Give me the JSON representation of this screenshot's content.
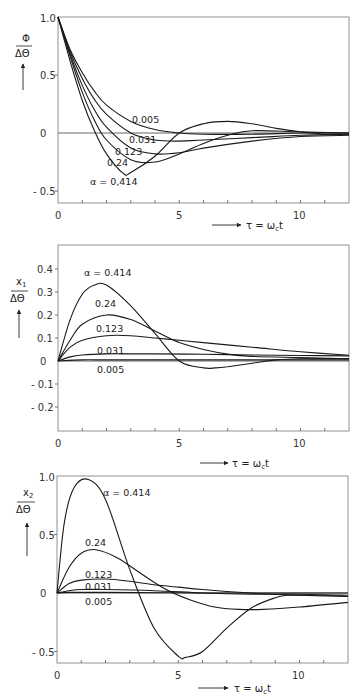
{
  "chart_data": [
    {
      "type": "line",
      "title": "",
      "ylabel_num": "Φ",
      "ylabel_den": "ΔΘ",
      "xlabel": "τ = ω_c t",
      "xlim": [
        0,
        12
      ],
      "ylim": [
        -0.6,
        1.0
      ],
      "xticks": [
        0,
        5,
        10
      ],
      "yticks": [
        1.0,
        0.5,
        0,
        -0.5
      ],
      "ytick_labels": [
        "1.0",
        "0.5",
        "0",
        "- 0.5"
      ],
      "series": [
        {
          "name": "0.005",
          "x": [
            0,
            0.5,
            1,
            1.5,
            2,
            3,
            4,
            5,
            6,
            8,
            10,
            12
          ],
          "y": [
            1.0,
            0.72,
            0.52,
            0.36,
            0.24,
            0.1,
            0.03,
            0.0,
            -0.01,
            -0.01,
            0.0,
            0.0
          ]
        },
        {
          "name": "0.031",
          "x": [
            0,
            0.5,
            1,
            1.5,
            2,
            3,
            4,
            5,
            6,
            8,
            10,
            12
          ],
          "y": [
            1.0,
            0.7,
            0.47,
            0.29,
            0.16,
            0.0,
            -0.06,
            -0.07,
            -0.06,
            -0.04,
            -0.02,
            -0.01
          ]
        },
        {
          "name": "0.123",
          "x": [
            0,
            0.5,
            1,
            1.5,
            2,
            3,
            4,
            5,
            6,
            8,
            10,
            12
          ],
          "y": [
            1.0,
            0.68,
            0.41,
            0.2,
            0.05,
            -0.13,
            -0.18,
            -0.17,
            -0.13,
            -0.07,
            -0.03,
            -0.02
          ]
        },
        {
          "name": "0.24",
          "x": [
            0,
            0.5,
            1,
            1.5,
            2,
            3,
            4,
            5,
            6,
            7,
            8,
            10,
            12
          ],
          "y": [
            1.0,
            0.66,
            0.35,
            0.11,
            -0.06,
            -0.23,
            -0.25,
            -0.18,
            -0.09,
            -0.02,
            0.02,
            0.01,
            0.0
          ]
        },
        {
          "name": "α = 0.414",
          "x": [
            0,
            0.5,
            1,
            1.5,
            2,
            2.7,
            3,
            4,
            5,
            6,
            7,
            8,
            9,
            10,
            11,
            12
          ],
          "y": [
            1.0,
            0.62,
            0.28,
            0.02,
            -0.18,
            -0.35,
            -0.34,
            -0.2,
            0.0,
            0.08,
            0.1,
            0.08,
            0.04,
            0.01,
            -0.01,
            -0.01
          ]
        }
      ]
    },
    {
      "type": "line",
      "title": "",
      "ylabel_num": "x₁",
      "ylabel_den": "ΔΘ",
      "xlabel": "τ = ω_c t",
      "xlim": [
        0,
        12
      ],
      "ylim": [
        -0.3,
        0.45
      ],
      "xticks": [
        0,
        5,
        10
      ],
      "yticks": [
        0.4,
        0.3,
        0.2,
        0.1,
        0,
        -0.1,
        -0.2
      ],
      "ytick_labels": [
        "0.4",
        "0.3",
        "0.2",
        "0.1",
        "0",
        "- 0.1",
        "- 0.2"
      ],
      "series": [
        {
          "name": "0.005",
          "x": [
            0,
            1,
            2,
            4,
            6,
            8,
            10,
            12
          ],
          "y": [
            0,
            0.005,
            0.005,
            0.005,
            0.005,
            0.005,
            0.005,
            0.005
          ]
        },
        {
          "name": "0.031",
          "x": [
            0,
            0.5,
            1,
            2,
            3,
            4,
            6,
            8,
            10,
            12
          ],
          "y": [
            0,
            0.018,
            0.026,
            0.031,
            0.031,
            0.031,
            0.029,
            0.026,
            0.024,
            0.022
          ]
        },
        {
          "name": "0.123",
          "x": [
            0,
            0.5,
            1,
            2,
            3,
            4,
            5,
            6,
            8,
            10,
            12
          ],
          "y": [
            0,
            0.06,
            0.09,
            0.11,
            0.11,
            0.1,
            0.09,
            0.08,
            0.06,
            0.04,
            0.025
          ]
        },
        {
          "name": "0.24",
          "x": [
            0,
            0.5,
            1,
            2,
            3,
            4,
            5,
            6,
            7,
            8,
            10,
            12
          ],
          "y": [
            0,
            0.09,
            0.16,
            0.2,
            0.18,
            0.13,
            0.08,
            0.05,
            0.03,
            0.02,
            0.015,
            0.01
          ]
        },
        {
          "name": "α = 0.414",
          "x": [
            0,
            0.5,
            1,
            1.5,
            2,
            3,
            4,
            5,
            6,
            6.5,
            7,
            8,
            9,
            10,
            12
          ],
          "y": [
            0,
            0.18,
            0.29,
            0.33,
            0.33,
            0.24,
            0.12,
            0.0,
            -0.03,
            -0.03,
            -0.025,
            -0.01,
            0.005,
            0.01,
            0.01
          ]
        }
      ]
    },
    {
      "type": "line",
      "title": "",
      "ylabel_num": "x₂",
      "ylabel_den": "ΔΘ",
      "xlabel": "τ = ω_c t",
      "xlim": [
        0,
        12
      ],
      "ylim": [
        -0.6,
        1.0
      ],
      "xticks": [
        0,
        5,
        10
      ],
      "yticks": [
        1.0,
        0.5,
        0,
        -0.5
      ],
      "ytick_labels": [
        "1.0",
        "0.5",
        "0",
        "- 0.5"
      ],
      "series": [
        {
          "name": "0.005",
          "x": [
            0,
            0.5,
            2,
            6,
            10,
            12
          ],
          "y": [
            0,
            0.005,
            0.005,
            0.0,
            0.0,
            0.0
          ]
        },
        {
          "name": "0.031",
          "x": [
            0,
            0.5,
            1,
            2,
            4,
            6,
            8,
            10,
            12
          ],
          "y": [
            0,
            0.02,
            0.03,
            0.03,
            0.02,
            0.0,
            -0.01,
            -0.01,
            -0.02
          ]
        },
        {
          "name": "0.123",
          "x": [
            0,
            0.5,
            1,
            2,
            3,
            4,
            5,
            6,
            8,
            10,
            12
          ],
          "y": [
            0,
            0.08,
            0.11,
            0.12,
            0.1,
            0.07,
            0.05,
            0.03,
            0.0,
            -0.02,
            -0.03
          ]
        },
        {
          "name": "0.24",
          "x": [
            0,
            0.5,
            1,
            1.6,
            2.5,
            3.5,
            4.5,
            5.5,
            6.5,
            7.5,
            8.5,
            10,
            12
          ],
          "y": [
            0,
            0.22,
            0.34,
            0.37,
            0.3,
            0.16,
            0.03,
            -0.06,
            -0.12,
            -0.14,
            -0.14,
            -0.12,
            -0.08
          ]
        },
        {
          "name": "α = 0.414",
          "x": [
            0,
            0.3,
            0.7,
            1.3,
            2,
            3,
            4,
            5,
            5.3,
            6,
            7,
            8,
            9,
            9.5,
            10,
            11,
            12
          ],
          "y": [
            0,
            0.6,
            0.9,
            0.97,
            0.8,
            0.2,
            -0.3,
            -0.54,
            -0.55,
            -0.5,
            -0.3,
            -0.13,
            -0.04,
            -0.02,
            -0.02,
            -0.02,
            -0.03
          ]
        }
      ]
    }
  ],
  "labels": {
    "p1": {
      "l005": "0.005",
      "l031": "0.031",
      "l123": "0.123",
      "l24": "0.24",
      "l414": "α = 0,414",
      "yn": "Φ",
      "yd": "ΔΘ",
      "x": "τ = ω",
      "xsub": "c",
      "xt": "t",
      "t0": "0",
      "t5": "5",
      "t10": "10",
      "y1": "1.0",
      "y05": "0.5",
      "y0": "0",
      "ym05": "- 0.5"
    },
    "p2": {
      "l005": "0.005",
      "l031": "0.031",
      "l123": "0.123",
      "l24": "0.24",
      "l414": "α = 0.414",
      "yn": "x",
      "ysub": "1",
      "yd": "ΔΘ",
      "x": "τ = ω",
      "xsub": "c",
      "xt": "t",
      "t0": "0",
      "t5": "5",
      "t10": "10",
      "y04": "0.4",
      "y03": "0.3",
      "y02": "0.2",
      "y01": "0.1",
      "y0": "0",
      "ym01": "- 0.1",
      "ym02": "- 0.2"
    },
    "p3": {
      "l005": "0.005",
      "l031": "0.031",
      "l123": "0.123",
      "l24": "0.24",
      "l414": "α = 0.414",
      "yn": "x",
      "ysub": "2",
      "yd": "ΔΘ",
      "x": "τ = ω",
      "xsub": "c",
      "xt": "t",
      "t0": "0",
      "t5": "5",
      "t10": "10",
      "y1": "1.0",
      "y05": "0.5",
      "y0": "0",
      "ym05": "- 0.5"
    }
  }
}
